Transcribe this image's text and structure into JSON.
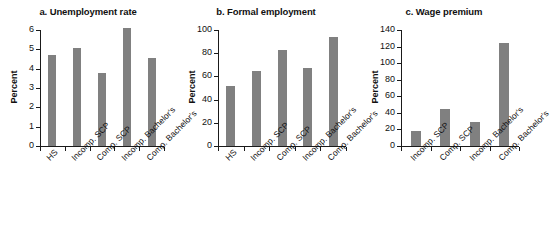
{
  "figure": {
    "axis_title": "Percent",
    "bar_color": "#808080",
    "axis_color": "#1a1a1a",
    "background": "#ffffff"
  },
  "chart_data": [
    {
      "type": "bar",
      "panel": "a",
      "title": "a. Unemployment rate",
      "xlabel": "",
      "ylabel": "Percent",
      "ylim": [
        0,
        6
      ],
      "yticks": [
        0,
        1,
        2,
        3,
        4,
        5,
        6
      ],
      "grid": false,
      "legend": "none",
      "categories": [
        "HS",
        "Incomp. SCP",
        "Comp. SCP",
        "Incomp. Bachelor's",
        "Comp. Bachelor's"
      ],
      "values": [
        4.7,
        5.05,
        3.75,
        6.1,
        4.55
      ]
    },
    {
      "type": "bar",
      "panel": "b",
      "title": "b. Formal employment",
      "xlabel": "",
      "ylabel": "Percent",
      "ylim": [
        0,
        100
      ],
      "yticks": [
        0,
        20,
        40,
        60,
        80,
        100
      ],
      "grid": false,
      "legend": "none",
      "categories": [
        "HS",
        "Incomp. SCP",
        "Comp. SCP",
        "Incomp. Bachelor's",
        "Comp. Bachelor's"
      ],
      "values": [
        52,
        65,
        82.5,
        67,
        94
      ]
    },
    {
      "type": "bar",
      "panel": "c",
      "title": "c. Wage premium",
      "xlabel": "",
      "ylabel": "Percent",
      "ylim": [
        0,
        140
      ],
      "yticks": [
        0,
        20,
        40,
        60,
        80,
        100,
        120,
        140
      ],
      "grid": false,
      "legend": "none",
      "categories": [
        "Incomp. SCP",
        "Comp. SCP",
        "Incomp. Bachelor's",
        "Comp. Bachelor's"
      ],
      "values": [
        18,
        45,
        28.5,
        124
      ]
    }
  ]
}
